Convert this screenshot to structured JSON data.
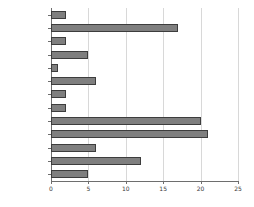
{
  "chart_data": {
    "type": "bar",
    "orientation": "horizontal",
    "title": "",
    "xlabel": "",
    "ylabel": "",
    "xlim": [
      0,
      25
    ],
    "xticks": [
      0,
      5,
      10,
      15,
      20,
      25
    ],
    "grid": true,
    "legend": null,
    "bar_color": "#7f7f7f",
    "bar_border_color": "#3d3d3d",
    "categories": [
      "Others",
      "Spain",
      "Portugal",
      "Netherlands",
      "Luxembourg",
      "Italy",
      "Ireland",
      "Greece",
      "Great Britain",
      "France",
      "Denmark",
      "Germany",
      "Belgium"
    ],
    "values": [
      2,
      17,
      2,
      5,
      1,
      6,
      2,
      2,
      20,
      21,
      6,
      12,
      5
    ]
  }
}
